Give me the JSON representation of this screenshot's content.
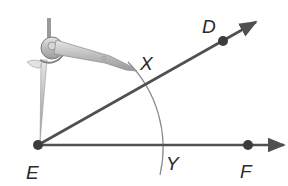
{
  "diagram": {
    "type": "geometric-construction",
    "colors": {
      "ray": "#505050",
      "point": "#3c3c3c",
      "arc": "#8a8a8a",
      "label": "#2a2a2a",
      "compass_body": "#c8c8c8",
      "compass_outline": "#7a7a7a"
    },
    "points": [
      {
        "id": "E",
        "label": "E",
        "x": 38,
        "y": 145,
        "label_x": 26,
        "label_y": 179
      },
      {
        "id": "D",
        "label": "D",
        "x": 223,
        "y": 41,
        "label_x": 202,
        "label_y": 33
      },
      {
        "id": "F",
        "label": "F",
        "x": 248,
        "y": 145,
        "label_x": 240,
        "label_y": 178
      },
      {
        "id": "X",
        "label": "X",
        "x": 144,
        "y": 86,
        "label_x": 140,
        "label_y": 70
      },
      {
        "id": "Y",
        "label": "Y",
        "x": 160,
        "y": 145,
        "label_x": 166,
        "label_y": 170
      }
    ],
    "rays": [
      {
        "name": "ray-ED",
        "from": "E",
        "through": "D",
        "end_x": 256,
        "end_y": 22
      },
      {
        "name": "ray-EF",
        "from": "E",
        "through": "F",
        "end_x": 284,
        "end_y": 145
      }
    ],
    "arc": {
      "center": "E",
      "radius": 122,
      "through": [
        "X",
        "Y"
      ]
    },
    "tool": {
      "name": "compass",
      "needle_point": "E",
      "pencil_near": "X"
    }
  }
}
